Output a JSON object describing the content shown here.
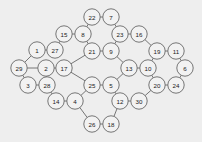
{
  "figure": {
    "type": "node-link-graph",
    "background_color": "#eeeeee",
    "node_fill_color": "#f2f2f2",
    "node_stroke_color": "#555555",
    "edge_color": "#555555",
    "label_color": "#1a1a1a",
    "width": 202,
    "height": 142,
    "node_radius": 8.2
  },
  "graph_data": {
    "node_count": 30,
    "edge_count": 36,
    "nodes": [
      {
        "id": "n1",
        "label": "1",
        "x": 37,
        "y": 50
      },
      {
        "id": "n2",
        "label": "27",
        "x": 55,
        "y": 50
      },
      {
        "id": "n3",
        "label": "15",
        "x": 64,
        "y": 34
      },
      {
        "id": "n4",
        "label": "8",
        "x": 83,
        "y": 34
      },
      {
        "id": "n5",
        "label": "22",
        "x": 92,
        "y": 17
      },
      {
        "id": "n6",
        "label": "7",
        "x": 111,
        "y": 17
      },
      {
        "id": "n7",
        "label": "21",
        "x": 92,
        "y": 51
      },
      {
        "id": "n8",
        "label": "9",
        "x": 111,
        "y": 51
      },
      {
        "id": "n9",
        "label": "23",
        "x": 120,
        "y": 34
      },
      {
        "id": "n10",
        "label": "16",
        "x": 139,
        "y": 34
      },
      {
        "id": "n11",
        "label": "19",
        "x": 157,
        "y": 51
      },
      {
        "id": "n12",
        "label": "11",
        "x": 176,
        "y": 51
      },
      {
        "id": "n13",
        "label": "10",
        "x": 148,
        "y": 68
      },
      {
        "id": "n14",
        "label": "6",
        "x": 185,
        "y": 68
      },
      {
        "id": "n15",
        "label": "13",
        "x": 129,
        "y": 68
      },
      {
        "id": "n16",
        "label": "17",
        "x": 64,
        "y": 68
      },
      {
        "id": "n17",
        "label": "2",
        "x": 46,
        "y": 68
      },
      {
        "id": "n18",
        "label": "29",
        "x": 19,
        "y": 68
      },
      {
        "id": "n19",
        "label": "3",
        "x": 28,
        "y": 85
      },
      {
        "id": "n20",
        "label": "28",
        "x": 47,
        "y": 85
      },
      {
        "id": "n21",
        "label": "14",
        "x": 56,
        "y": 101
      },
      {
        "id": "n22",
        "label": "4",
        "x": 75,
        "y": 101
      },
      {
        "id": "n23",
        "label": "25",
        "x": 92,
        "y": 85
      },
      {
        "id": "n24",
        "label": "5",
        "x": 111,
        "y": 85
      },
      {
        "id": "n25",
        "label": "12",
        "x": 120,
        "y": 101
      },
      {
        "id": "n26",
        "label": "30",
        "x": 139,
        "y": 101
      },
      {
        "id": "n27",
        "label": "20",
        "x": 157,
        "y": 85
      },
      {
        "id": "n28",
        "label": "24",
        "x": 176,
        "y": 85
      },
      {
        "id": "n29",
        "label": "26",
        "x": 92,
        "y": 124
      },
      {
        "id": "n30",
        "label": "18",
        "x": 111,
        "y": 124
      }
    ],
    "edges": [
      [
        "n1",
        "n2"
      ],
      [
        "n2",
        "n3"
      ],
      [
        "n3",
        "n4"
      ],
      [
        "n4",
        "n5"
      ],
      [
        "n5",
        "n6"
      ],
      [
        "n6",
        "n9"
      ],
      [
        "n4",
        "n7"
      ],
      [
        "n7",
        "n8"
      ],
      [
        "n8",
        "n9"
      ],
      [
        "n9",
        "n10"
      ],
      [
        "n10",
        "n11"
      ],
      [
        "n11",
        "n12"
      ],
      [
        "n12",
        "n14"
      ],
      [
        "n11",
        "n13"
      ],
      [
        "n13",
        "n15"
      ],
      [
        "n13",
        "n27"
      ],
      [
        "n14",
        "n28"
      ],
      [
        "n27",
        "n28"
      ],
      [
        "n15",
        "n24"
      ],
      [
        "n8",
        "n15"
      ],
      [
        "n7",
        "n16"
      ],
      [
        "n16",
        "n17"
      ],
      [
        "n17",
        "n18"
      ],
      [
        "n1",
        "n18"
      ],
      [
        "n18",
        "n19"
      ],
      [
        "n19",
        "n20"
      ],
      [
        "n17",
        "n20"
      ],
      [
        "n20",
        "n21"
      ],
      [
        "n21",
        "n22"
      ],
      [
        "n22",
        "n23"
      ],
      [
        "n16",
        "n23"
      ],
      [
        "n23",
        "n24"
      ],
      [
        "n24",
        "n25"
      ],
      [
        "n25",
        "n26"
      ],
      [
        "n26",
        "n27"
      ],
      [
        "n22",
        "n29"
      ],
      [
        "n29",
        "n30"
      ],
      [
        "n30",
        "n25"
      ]
    ]
  }
}
